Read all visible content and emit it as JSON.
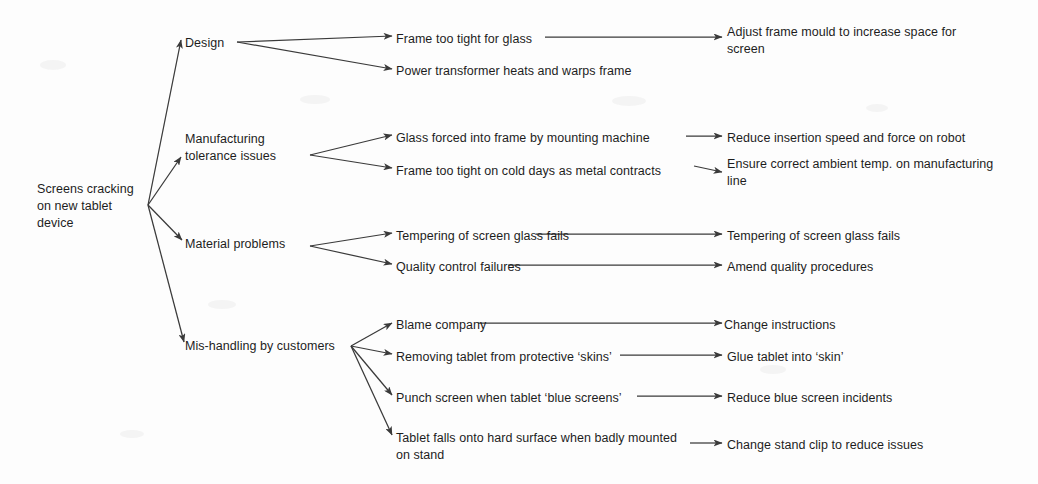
{
  "diagram": {
    "line_color": "#3a3a3a",
    "text_color": "#1d1d1d",
    "background": "#fdfdfd"
  },
  "root": {
    "label": "Screens cracking\non new tablet\ndevice",
    "x": 37,
    "y": 181
  },
  "categories": [
    {
      "label": "Design",
      "x": 185,
      "y": 35
    },
    {
      "label": "Manufacturing\ntolerance issues",
      "x": 185,
      "y": 131
    },
    {
      "label": "Material problems",
      "x": 185,
      "y": 236
    },
    {
      "label": "Mis-handling by customers",
      "x": 185,
      "y": 338
    }
  ],
  "causes": [
    {
      "label": "Frame too tight for glass",
      "x": 396,
      "y": 31
    },
    {
      "label": "Power transformer heats and warps frame",
      "x": 396,
      "y": 63
    },
    {
      "label": "Glass forced into frame by mounting machine",
      "x": 396,
      "y": 130
    },
    {
      "label": "Frame too tight on cold days as metal contracts",
      "x": 396,
      "y": 163
    },
    {
      "label": "Tempering of screen glass fails",
      "x": 396,
      "y": 228
    },
    {
      "label": "Quality control failures",
      "x": 396,
      "y": 259
    },
    {
      "label": "Blame company",
      "x": 396,
      "y": 317
    },
    {
      "label": "Removing tablet from protective ‘skins’",
      "x": 396,
      "y": 349
    },
    {
      "label": "Punch screen when tablet ‘blue screens’",
      "x": 396,
      "y": 390
    },
    {
      "label": "Tablet falls onto hard surface when badly mounted\non stand",
      "x": 396,
      "y": 430
    }
  ],
  "actions": [
    {
      "label": "Adjust frame mould to increase space for\nscreen",
      "x": 727,
      "y": 24
    },
    {
      "label": "Reduce insertion speed and force on robot",
      "x": 727,
      "y": 130
    },
    {
      "label": "Ensure correct ambient temp. on manufacturing\nline",
      "x": 727,
      "y": 156
    },
    {
      "label": "Tempering of screen glass fails",
      "x": 727,
      "y": 228
    },
    {
      "label": "Amend quality procedures",
      "x": 727,
      "y": 259
    },
    {
      "label": "Change instructions",
      "x": 724,
      "y": 317
    },
    {
      "label": "Glue tablet into ‘skin’",
      "x": 727,
      "y": 349
    },
    {
      "label": "Reduce blue screen incidents",
      "x": 727,
      "y": 390
    },
    {
      "label": "Change stand clip to reduce issues",
      "x": 727,
      "y": 437
    }
  ],
  "connectors": {
    "root_hub": {
      "x": 148,
      "y": 205
    },
    "category_hubs": [
      {
        "name": "design-hub",
        "x": 237,
        "y": 42
      },
      {
        "name": "manufacturing-hub",
        "x": 310,
        "y": 155
      },
      {
        "name": "material-hub",
        "x": 310,
        "y": 246
      },
      {
        "name": "mishandling-hub",
        "x": 351,
        "y": 346
      }
    ]
  }
}
